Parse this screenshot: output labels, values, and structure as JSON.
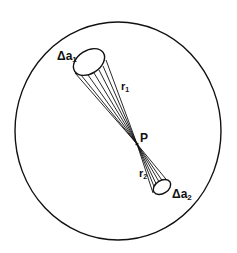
{
  "diagram": {
    "type": "solid-angle-geometry",
    "outer_circle": {
      "cx": 118,
      "cy": 131,
      "rx": 103,
      "ry": 109
    },
    "point_P": {
      "x": 137,
      "y": 144,
      "label": "P"
    },
    "area_1": {
      "label_main": "Δa",
      "label_sub": "1",
      "ellipse": {
        "cx": 89,
        "cy": 62,
        "rx": 17,
        "ry": 11.5,
        "rotate": -33
      },
      "distance_label_main": "r",
      "distance_label_sub": "1"
    },
    "area_2": {
      "label_main": "Δa",
      "label_sub": "2",
      "ellipse": {
        "cx": 162,
        "cy": 187,
        "rx": 9.5,
        "ry": 6.5,
        "rotate": -33
      },
      "distance_label_main": "r",
      "distance_label_sub": "2"
    },
    "stroke_color": "#111111",
    "background": "#ffffff"
  }
}
